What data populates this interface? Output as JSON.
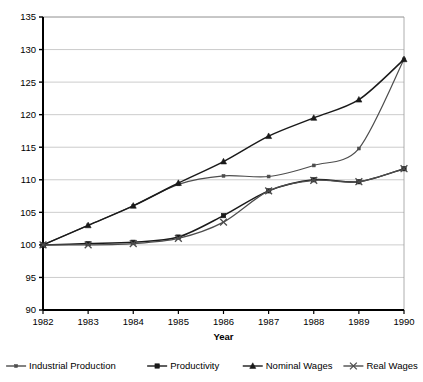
{
  "chart_data": {
    "type": "line",
    "title": "",
    "xlabel": "Year",
    "ylabel": "",
    "x": [
      1982,
      1983,
      1984,
      1985,
      1986,
      1987,
      1988,
      1989,
      1990
    ],
    "categories": [
      "1982",
      "1983",
      "1984",
      "1985",
      "1986",
      "1987",
      "1988",
      "1989",
      "1990"
    ],
    "xlim": [
      1982,
      1990
    ],
    "ylim": [
      90,
      135
    ],
    "yticks": [
      90,
      95,
      100,
      105,
      110,
      115,
      120,
      125,
      130,
      135
    ],
    "ytick_labels": [
      "90",
      "95",
      "100",
      "105",
      "110",
      "115",
      "120",
      "125",
      "130",
      "135"
    ],
    "grid": "horizontal",
    "legend_position": "bottom",
    "series": [
      {
        "name": "Industrial Production",
        "marker": "dash-dot-small",
        "color": "#4d4d4d",
        "values": [
          100.0,
          103.0,
          106.0,
          109.3,
          110.6,
          110.5,
          112.2,
          114.8,
          128.5
        ]
      },
      {
        "name": "Productivity",
        "marker": "square",
        "color": "#1a1a1a",
        "values": [
          100.0,
          100.2,
          100.4,
          101.2,
          104.5,
          108.3,
          110.0,
          109.7,
          111.7
        ]
      },
      {
        "name": "Nominal Wages",
        "marker": "triangle",
        "color": "#1a1a1a",
        "values": [
          100.0,
          103.0,
          106.0,
          109.5,
          112.8,
          116.7,
          119.5,
          122.3,
          128.5
        ]
      },
      {
        "name": "Real Wages",
        "marker": "cross",
        "color": "#4d4d4d",
        "values": [
          100.0,
          100.0,
          100.2,
          101.0,
          103.5,
          108.3,
          109.9,
          109.7,
          111.7
        ]
      }
    ]
  },
  "legend": {
    "items": [
      {
        "label": "Industrial Production"
      },
      {
        "label": "Productivity"
      },
      {
        "label": "Nominal Wages"
      },
      {
        "label": "Real Wages"
      }
    ]
  }
}
